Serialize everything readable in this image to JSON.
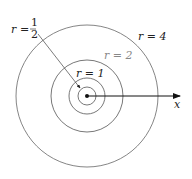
{
  "diagram": {
    "center": {
      "x": 87,
      "y": 96
    },
    "circles": [
      {
        "label": "r = 1/2",
        "r_value": 0.5,
        "radius_px": 9
      },
      {
        "label": "r = 1",
        "r_value": 1,
        "radius_px": 18
      },
      {
        "label": "r = 2",
        "r_value": 2,
        "radius_px": 36
      },
      {
        "label": "r = 4",
        "r_value": 4,
        "radius_px": 71
      }
    ],
    "labels": {
      "r_half_var": "r",
      "r_half_eq": "=",
      "r_half_num": "1",
      "r_half_den": "2",
      "r1": "r = 1",
      "r2": "r = 2",
      "r4": "r = 4",
      "x_axis": "x"
    },
    "colors": {
      "line": "#555555",
      "axis": "#111111",
      "gray_label": "#888888"
    }
  }
}
